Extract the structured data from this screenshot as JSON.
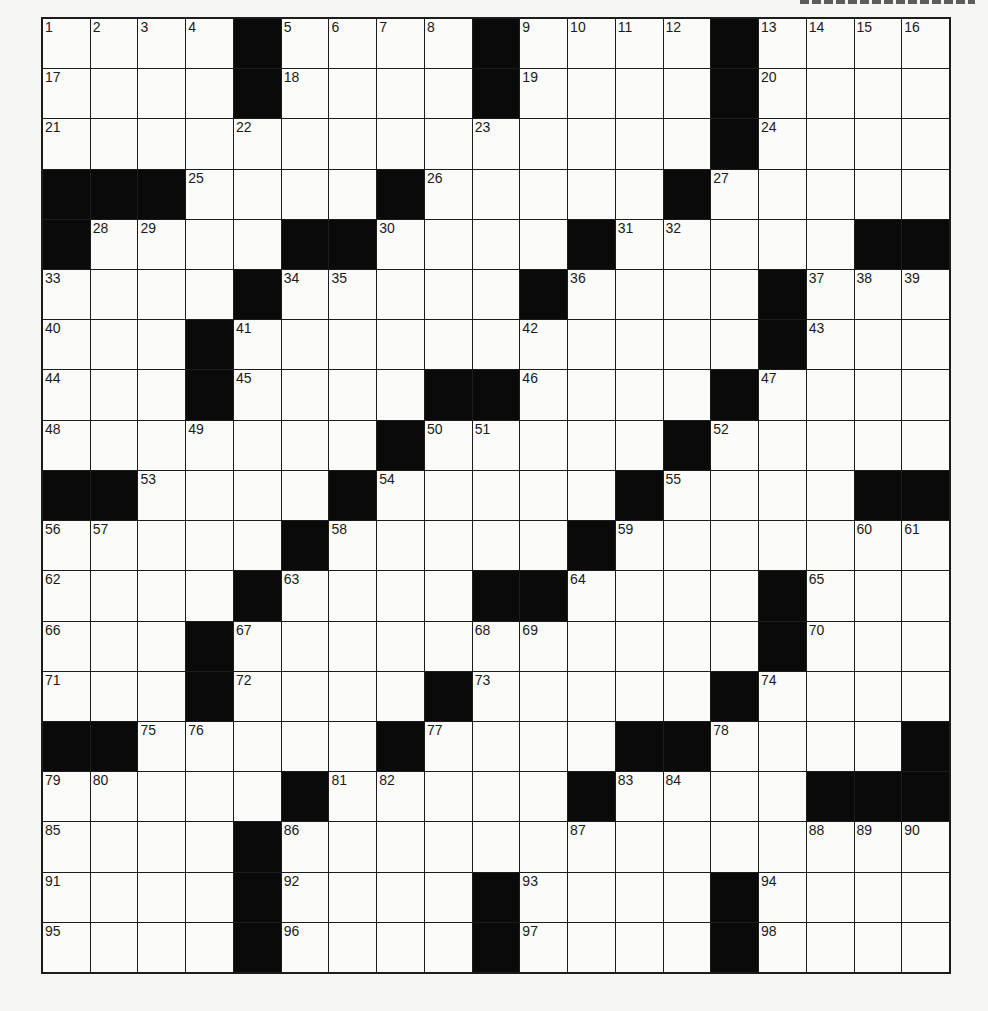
{
  "puzzle": {
    "rows": 19,
    "cols": 19,
    "colors": {
      "block": "#0a0a0a",
      "cell": "#fbfbf9",
      "line": "#1c1c1c",
      "paper": "#f6f6f3"
    },
    "layout": [
      "....#....#....#....",
      "....#....#....#....",
      "..............#....",
      "###....#.....#.....",
      "#....##....#.....##",
      "....#.....#....#...",
      "...#...........#...",
      "...#....##....#....",
      ".......#.....#.....",
      "##....#.....#....##",
      ".....#.....#.......",
      "....#....##....#...",
      "...#...........#...",
      "...#....#.....#....",
      "##.....#....##....#",
      ".....#.....#....###",
      "....#..............",
      "....#....#....#....",
      "....#....#....#...."
    ],
    "numbers": [
      [
        1,
        2,
        3,
        4,
        null,
        5,
        6,
        7,
        8,
        null,
        9,
        10,
        11,
        12,
        null,
        13,
        14,
        15,
        16
      ],
      [
        17,
        null,
        null,
        null,
        null,
        18,
        null,
        null,
        null,
        null,
        19,
        null,
        null,
        null,
        null,
        20,
        null,
        null,
        null
      ],
      [
        21,
        null,
        null,
        null,
        22,
        null,
        null,
        null,
        null,
        23,
        null,
        null,
        null,
        null,
        null,
        24,
        null,
        null,
        null
      ],
      [
        null,
        null,
        null,
        25,
        null,
        null,
        null,
        null,
        26,
        null,
        null,
        null,
        null,
        null,
        27,
        null,
        null,
        null,
        null
      ],
      [
        null,
        28,
        29,
        null,
        null,
        null,
        null,
        30,
        null,
        null,
        null,
        null,
        31,
        32,
        null,
        null,
        null,
        null,
        null
      ],
      [
        33,
        null,
        null,
        null,
        null,
        34,
        35,
        null,
        null,
        null,
        null,
        36,
        null,
        null,
        null,
        null,
        37,
        38,
        39
      ],
      [
        40,
        null,
        null,
        null,
        41,
        null,
        null,
        null,
        null,
        null,
        42,
        null,
        null,
        null,
        null,
        null,
        43,
        null,
        null
      ],
      [
        44,
        null,
        null,
        null,
        45,
        null,
        null,
        null,
        null,
        null,
        46,
        null,
        null,
        null,
        null,
        47,
        null,
        null,
        null
      ],
      [
        48,
        null,
        null,
        49,
        null,
        null,
        null,
        null,
        50,
        51,
        null,
        null,
        null,
        null,
        52,
        null,
        null,
        null,
        null
      ],
      [
        null,
        null,
        53,
        null,
        null,
        null,
        null,
        54,
        null,
        null,
        null,
        null,
        null,
        55,
        null,
        null,
        null,
        null,
        null
      ],
      [
        56,
        57,
        null,
        null,
        null,
        null,
        58,
        null,
        null,
        null,
        null,
        null,
        59,
        null,
        null,
        null,
        null,
        60,
        61
      ],
      [
        62,
        null,
        null,
        null,
        null,
        63,
        null,
        null,
        null,
        null,
        null,
        64,
        null,
        null,
        null,
        null,
        65,
        null,
        null
      ],
      [
        66,
        null,
        null,
        null,
        67,
        null,
        null,
        null,
        null,
        68,
        69,
        null,
        null,
        null,
        null,
        null,
        70,
        null,
        null
      ],
      [
        71,
        null,
        null,
        null,
        72,
        null,
        null,
        null,
        null,
        73,
        null,
        null,
        null,
        null,
        null,
        74,
        null,
        null,
        null
      ],
      [
        null,
        null,
        75,
        76,
        null,
        null,
        null,
        null,
        77,
        null,
        null,
        null,
        null,
        null,
        78,
        null,
        null,
        null,
        null
      ],
      [
        79,
        80,
        null,
        null,
        null,
        null,
        81,
        82,
        null,
        null,
        null,
        null,
        83,
        84,
        null,
        null,
        null,
        null,
        null
      ],
      [
        85,
        null,
        null,
        null,
        null,
        86,
        null,
        null,
        null,
        null,
        null,
        87,
        null,
        null,
        null,
        null,
        88,
        89,
        90
      ],
      [
        91,
        null,
        null,
        null,
        null,
        92,
        null,
        null,
        null,
        null,
        null,
        93,
        null,
        null,
        null,
        null,
        94,
        null,
        null
      ],
      [
        95,
        null,
        null,
        null,
        null,
        96,
        null,
        null,
        null,
        null,
        null,
        97,
        null,
        null,
        null,
        null,
        98,
        null,
        null
      ]
    ],
    "entries": []
  }
}
